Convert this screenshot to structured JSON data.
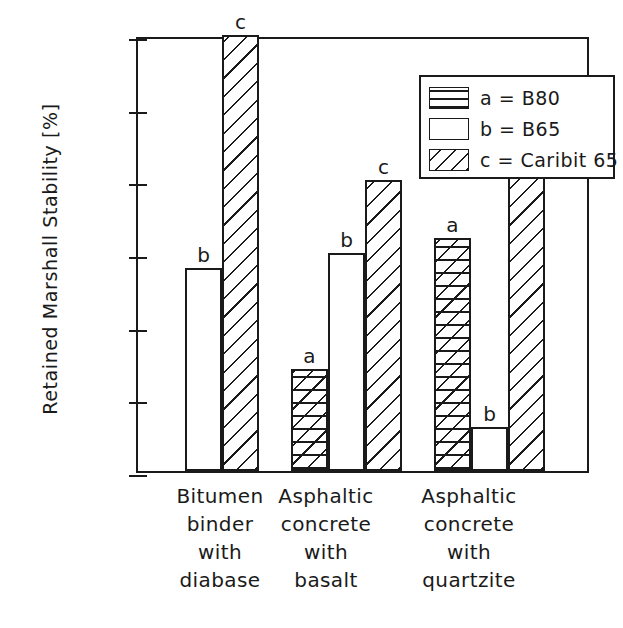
{
  "chart_data": {
    "type": "bar",
    "title": "",
    "xlabel": "",
    "ylabel": "Retained Marshall Stability [%]",
    "ylim": [
      70,
      100
    ],
    "yticks": [
      70,
      75,
      80,
      85,
      90,
      95,
      100
    ],
    "ytick_labels": [
      "70",
      "75",
      "80",
      "85",
      "90",
      "95",
      "100"
    ],
    "grid": false,
    "legend_position": "top-center",
    "categories": [
      "Bitumen binder with diabase",
      "Asphaltic concrete with basalt",
      "Asphaltic concrete with quartzite"
    ],
    "category_lines": [
      [
        "Bitumen",
        "binder",
        "with",
        "diabase"
      ],
      [
        "Asphaltic",
        "concrete",
        "with",
        "basalt"
      ],
      [
        "Asphaltic",
        "concrete",
        "with",
        "quartzite"
      ]
    ],
    "series": [
      {
        "name": "a = B80",
        "key": "a",
        "pattern": "cross-hatch",
        "values": [
          null,
          77,
          86
        ]
      },
      {
        "name": "b = B65",
        "key": "b",
        "pattern": "plain",
        "values": [
          84,
          85,
          73
        ]
      },
      {
        "name": "c = Caribit 65",
        "key": "c",
        "pattern": "diagonal-hatch",
        "values": [
          100,
          90,
          95
        ]
      }
    ],
    "bars": [
      {
        "group": 0,
        "key": "b",
        "label": "b",
        "value": 84,
        "pattern": "plain",
        "x": 183,
        "width": 37
      },
      {
        "group": 0,
        "key": "c",
        "label": "c",
        "value": 100,
        "pattern": "diagonal-hatch",
        "x": 220,
        "width": 37
      },
      {
        "group": 1,
        "key": "a",
        "label": "a",
        "value": 77,
        "pattern": "cross-hatch",
        "x": 289,
        "width": 37
      },
      {
        "group": 1,
        "key": "b",
        "label": "b",
        "value": 85,
        "pattern": "plain",
        "x": 326,
        "width": 37
      },
      {
        "group": 1,
        "key": "c",
        "label": "c",
        "value": 90,
        "pattern": "diagonal-hatch",
        "x": 363,
        "width": 37
      },
      {
        "group": 2,
        "key": "a",
        "label": "a",
        "value": 86,
        "pattern": "cross-hatch",
        "x": 432,
        "width": 37
      },
      {
        "group": 2,
        "key": "b",
        "label": "b",
        "value": 73,
        "pattern": "plain",
        "x": 469,
        "width": 37
      },
      {
        "group": 2,
        "key": "c",
        "label": "c",
        "value": 95,
        "pattern": "diagonal-hatch",
        "x": 506,
        "width": 37
      }
    ],
    "legend_entries": [
      {
        "key": "a",
        "text": "a  =  B80",
        "pattern": "horizontal-lines"
      },
      {
        "key": "b",
        "text": "b  =  B65",
        "pattern": "plain"
      },
      {
        "key": "c",
        "text": "c  =  Caribit 65",
        "pattern": "diagonal-hatch"
      }
    ],
    "category_centers": [
      220,
      326,
      469
    ],
    "colors": {
      "line": "#1a1a1a",
      "background": "#ffffff"
    }
  }
}
